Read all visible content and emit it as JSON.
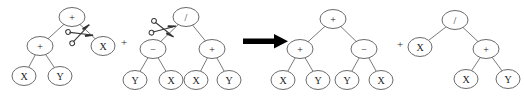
{
  "figure": {
    "background_color": "#ffffff",
    "node_stroke_color": "#6b6b6b",
    "edge_color": "#6b6b6b",
    "label_color": "#1a1a1a",
    "arrow_color": "#000000",
    "scissors_color": "#3a3a3a"
  },
  "operators": {
    "plus_between_parents": "+",
    "plus_between_children": "+",
    "arrow": "⟹"
  },
  "trees": [
    {
      "id": "parent-1",
      "role": "parent",
      "cut_edge": "root-to-right-child",
      "nodes": [
        {
          "id": "p1-root",
          "label": "+",
          "cx": 72,
          "cy": 17,
          "rx": 13,
          "ry": 9.5,
          "level": 0
        },
        {
          "id": "p1-l",
          "label": "+",
          "cx": 40,
          "cy": 46,
          "rx": 13,
          "ry": 9.5,
          "level": 1
        },
        {
          "id": "p1-r",
          "label": "X",
          "cx": 103,
          "cy": 46,
          "rx": 12,
          "ry": 9.5,
          "level": 1
        },
        {
          "id": "p1-ll",
          "label": "X",
          "cx": 24,
          "cy": 76,
          "rx": 12,
          "ry": 9.5,
          "level": 2
        },
        {
          "id": "p1-lr",
          "label": "Y",
          "cx": 60,
          "cy": 76,
          "rx": 12,
          "ry": 9.5,
          "level": 2
        }
      ],
      "edges": [
        {
          "from": "p1-root",
          "to": "p1-l"
        },
        {
          "from": "p1-root",
          "to": "p1-r"
        },
        {
          "from": "p1-l",
          "to": "p1-ll"
        },
        {
          "from": "p1-l",
          "to": "p1-lr"
        }
      ]
    },
    {
      "id": "parent-2",
      "role": "parent",
      "cut_edge": "root-to-left-child",
      "nodes": [
        {
          "id": "p2-root",
          "label": "/",
          "cx": 186,
          "cy": 17,
          "rx": 13,
          "ry": 9.5,
          "level": 0
        },
        {
          "id": "p2-l",
          "label": "−",
          "cx": 153,
          "cy": 49,
          "rx": 13,
          "ry": 9.5,
          "level": 1
        },
        {
          "id": "p2-r",
          "label": "+",
          "cx": 212,
          "cy": 49,
          "rx": 13,
          "ry": 9.5,
          "level": 1
        },
        {
          "id": "p2-ll",
          "label": "Y",
          "cx": 135,
          "cy": 80,
          "rx": 12,
          "ry": 9.5,
          "level": 2
        },
        {
          "id": "p2-lr",
          "label": "X",
          "cx": 171,
          "cy": 80,
          "rx": 12,
          "ry": 9.5,
          "level": 2
        },
        {
          "id": "p2-rl",
          "label": "X",
          "cx": 196,
          "cy": 80,
          "rx": 12,
          "ry": 9.5,
          "level": 2
        },
        {
          "id": "p2-rr",
          "label": "Y",
          "cx": 229,
          "cy": 80,
          "rx": 12,
          "ry": 9.5,
          "level": 2
        }
      ],
      "edges": [
        {
          "from": "p2-root",
          "to": "p2-l"
        },
        {
          "from": "p2-root",
          "to": "p2-r"
        },
        {
          "from": "p2-l",
          "to": "p2-ll"
        },
        {
          "from": "p2-l",
          "to": "p2-lr"
        },
        {
          "from": "p2-r",
          "to": "p2-rl"
        },
        {
          "from": "p2-r",
          "to": "p2-rr"
        }
      ]
    },
    {
      "id": "child-1",
      "role": "offspring",
      "cut_edge": null,
      "nodes": [
        {
          "id": "c1-root",
          "label": "+",
          "cx": 333,
          "cy": 19,
          "rx": 13,
          "ry": 9.5,
          "level": 0
        },
        {
          "id": "c1-l",
          "label": "+",
          "cx": 300,
          "cy": 49,
          "rx": 13,
          "ry": 9.5,
          "level": 1
        },
        {
          "id": "c1-r",
          "label": "−",
          "cx": 364,
          "cy": 49,
          "rx": 13,
          "ry": 9.5,
          "level": 1
        },
        {
          "id": "c1-ll",
          "label": "X",
          "cx": 283,
          "cy": 80,
          "rx": 12,
          "ry": 9.5,
          "level": 2
        },
        {
          "id": "c1-lr",
          "label": "Y",
          "cx": 318,
          "cy": 80,
          "rx": 12,
          "ry": 9.5,
          "level": 2
        },
        {
          "id": "c1-rl",
          "label": "Y",
          "cx": 347,
          "cy": 80,
          "rx": 12,
          "ry": 9.5,
          "level": 2
        },
        {
          "id": "c1-rr",
          "label": "X",
          "cx": 381,
          "cy": 80,
          "rx": 12,
          "ry": 9.5,
          "level": 2
        }
      ],
      "edges": [
        {
          "from": "c1-root",
          "to": "c1-l"
        },
        {
          "from": "c1-root",
          "to": "c1-r"
        },
        {
          "from": "c1-l",
          "to": "c1-ll"
        },
        {
          "from": "c1-l",
          "to": "c1-lr"
        },
        {
          "from": "c1-r",
          "to": "c1-rl"
        },
        {
          "from": "c1-r",
          "to": "c1-rr"
        }
      ]
    },
    {
      "id": "child-2",
      "role": "offspring",
      "cut_edge": null,
      "nodes": [
        {
          "id": "c2-root",
          "label": "/",
          "cx": 455,
          "cy": 20,
          "rx": 13,
          "ry": 9.5,
          "level": 0
        },
        {
          "id": "c2-l",
          "label": "X",
          "cx": 420,
          "cy": 47,
          "rx": 12,
          "ry": 9.5,
          "level": 1
        },
        {
          "id": "c2-r",
          "label": "+",
          "cx": 486,
          "cy": 49,
          "rx": 13,
          "ry": 9.5,
          "level": 1
        },
        {
          "id": "c2-rl",
          "label": "X",
          "cx": 466,
          "cy": 79,
          "rx": 12,
          "ry": 9.5,
          "level": 2
        },
        {
          "id": "c2-rr",
          "label": "Y",
          "cx": 508,
          "cy": 79,
          "rx": 12,
          "ry": 9.5,
          "level": 2
        }
      ],
      "edges": [
        {
          "from": "c2-root",
          "to": "c2-l"
        },
        {
          "from": "c2-root",
          "to": "c2-r"
        },
        {
          "from": "c2-r",
          "to": "c2-rl"
        },
        {
          "from": "c2-r",
          "to": "c2-rr"
        }
      ]
    }
  ],
  "scissors": [
    {
      "id": "scissors-1",
      "x": 80,
      "y": 34,
      "angle": -20,
      "target_edge": "parent-1 root to right child"
    },
    {
      "id": "scissors-2",
      "x": 163,
      "y": 29,
      "angle": 12,
      "target_edge": "parent-2 root to left child"
    }
  ],
  "annotations": {
    "plus_1": {
      "text": "+",
      "x": 124,
      "y": 42
    },
    "plus_2": {
      "text": "+",
      "x": 400,
      "y": 44
    },
    "arrow": {
      "x1": 243,
      "y1": 41,
      "x2": 288,
      "y2": 41
    }
  }
}
